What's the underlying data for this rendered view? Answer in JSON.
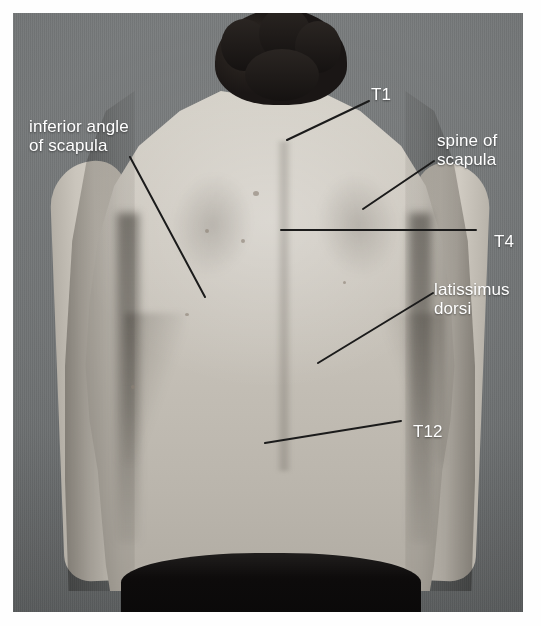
{
  "figure": {
    "kind": "anatomical-photograph",
    "background_color": "#6f7273",
    "label_color": "#ffffff",
    "leader_color": "#1b1b1b"
  },
  "labels": [
    {
      "id": "inferior-angle-of-scapula",
      "text": "inferior angle\nof scapula",
      "lines": [
        "inferior angle",
        "of scapula"
      ],
      "align": "left"
    },
    {
      "id": "t1",
      "text": "T1",
      "lines": [
        "T1"
      ],
      "align": "left"
    },
    {
      "id": "spine-of-scapula",
      "text": "spine of\nscapula",
      "lines": [
        "spine of",
        "scapula"
      ],
      "align": "left"
    },
    {
      "id": "t4",
      "text": "T4",
      "lines": [
        "T4"
      ],
      "align": "left"
    },
    {
      "id": "latissimus-dorsi",
      "text": "latissimus\ndorsi",
      "lines": [
        "latissimus",
        "dorsi"
      ],
      "align": "left"
    },
    {
      "id": "t12",
      "text": "T12",
      "lines": [
        "T12"
      ],
      "align": "left"
    }
  ],
  "leaders": [
    {
      "id": "leader-inferior-angle-of-scapula",
      "x1": 117,
      "y1": 144,
      "x2": 192,
      "y2": 284
    },
    {
      "id": "leader-t1",
      "x1": 356,
      "y1": 88,
      "x2": 274,
      "y2": 127
    },
    {
      "id": "leader-spine-of-scapula",
      "x1": 421,
      "y1": 148,
      "x2": 350,
      "y2": 196
    },
    {
      "id": "leader-t4",
      "x1": 268,
      "y1": 217,
      "x2": 463,
      "y2": 217
    },
    {
      "id": "leader-latissimus-dorsi",
      "x1": 420,
      "y1": 280,
      "x2": 305,
      "y2": 350
    },
    {
      "id": "leader-t12",
      "x1": 388,
      "y1": 408,
      "x2": 252,
      "y2": 430
    }
  ],
  "skin_marks": [
    {
      "id": "mole-upper-mid",
      "x": 240,
      "y": 178,
      "w": 6,
      "h": 5
    },
    {
      "id": "mole-mid-left",
      "x": 192,
      "y": 216,
      "w": 4,
      "h": 4
    },
    {
      "id": "mole-mid-right",
      "x": 228,
      "y": 226,
      "w": 4,
      "h": 4
    },
    {
      "id": "mole-lower-left",
      "x": 172,
      "y": 300,
      "w": 4,
      "h": 3
    },
    {
      "id": "mole-lower-right",
      "x": 330,
      "y": 268,
      "w": 3,
      "h": 3
    },
    {
      "id": "mole-flank-left",
      "x": 118,
      "y": 372,
      "w": 4,
      "h": 4
    }
  ]
}
